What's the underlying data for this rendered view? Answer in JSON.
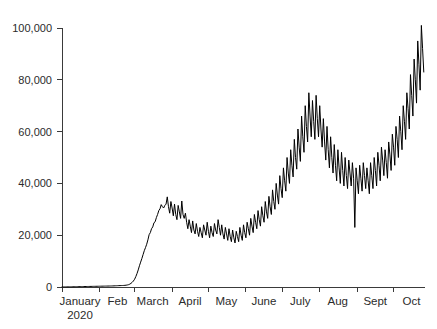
{
  "chart_data": {
    "type": "line",
    "title": "",
    "subtitle": "",
    "xlabel": "",
    "ylabel": "",
    "xlim": [
      0,
      300
    ],
    "ylim": [
      0,
      100000
    ],
    "grid": false,
    "legend": null,
    "line_color": "#000000",
    "axis_color": "#3a3a3a",
    "background_color": "#ffffff",
    "y_ticks": [
      0,
      20000,
      40000,
      60000,
      80000,
      100000
    ],
    "y_tick_labels": [
      "0",
      "20,000",
      "40,000",
      "60,000",
      "80,000",
      "100,000"
    ],
    "x_tick_labels": [
      {
        "label": "January",
        "sublabel": "2020"
      },
      {
        "label": "Feb",
        "sublabel": ""
      },
      {
        "label": "March",
        "sublabel": ""
      },
      {
        "label": "April",
        "sublabel": ""
      },
      {
        "label": "May",
        "sublabel": ""
      },
      {
        "label": "June",
        "sublabel": ""
      },
      {
        "label": "July",
        "sublabel": ""
      },
      {
        "label": "Aug",
        "sublabel": ""
      },
      {
        "label": "Sept",
        "sublabel": ""
      },
      {
        "label": "Oct",
        "sublabel": ""
      }
    ],
    "x_tick_positions_days": [
      0,
      31,
      60,
      91,
      121,
      152,
      182,
      213,
      244,
      274
    ],
    "series": [
      {
        "name": "daily-values",
        "x_start_day": 0,
        "values": [
          20,
          25,
          30,
          35,
          40,
          45,
          55,
          60,
          70,
          80,
          90,
          100,
          110,
          120,
          130,
          140,
          150,
          160,
          170,
          180,
          190,
          200,
          210,
          220,
          230,
          240,
          250,
          260,
          270,
          280,
          290,
          300,
          310,
          320,
          330,
          340,
          350,
          360,
          370,
          380,
          390,
          400,
          420,
          440,
          460,
          480,
          500,
          520,
          540,
          560,
          580,
          600,
          640,
          700,
          780,
          900,
          1100,
          1400,
          1800,
          2300,
          3000,
          4000,
          5200,
          6600,
          8200,
          9600,
          11000,
          12500,
          14000,
          15200,
          16500,
          18200,
          20200,
          21000,
          22500,
          23200,
          24800,
          25200,
          26800,
          28000,
          29500,
          30200,
          31800,
          31000,
          30500,
          31500,
          32000,
          34800,
          31000,
          28500,
          33000,
          30500,
          27500,
          32000,
          28000,
          26000,
          31500,
          29000,
          26500,
          33200,
          28000,
          26500,
          28500,
          25000,
          22500,
          26000,
          23500,
          21000,
          25500,
          22000,
          20500,
          24500,
          21500,
          19500,
          23000,
          21000,
          19000,
          24000,
          22000,
          20000,
          25000,
          21500,
          19000,
          23500,
          21000,
          19500,
          24500,
          22000,
          20500,
          26000,
          23000,
          20000,
          24000,
          20500,
          18500,
          23000,
          20500,
          18000,
          22500,
          19500,
          17500,
          22000,
          19000,
          17000,
          21500,
          19500,
          17500,
          23000,
          20000,
          18000,
          24000,
          21000,
          19000,
          25000,
          22500,
          20000,
          26500,
          23500,
          21000,
          28000,
          25000,
          22500,
          29500,
          26000,
          23500,
          31000,
          27500,
          25000,
          33000,
          29000,
          26500,
          35000,
          31000,
          28000,
          37500,
          33000,
          30000,
          40000,
          35500,
          32000,
          43000,
          38000,
          34500,
          46000,
          41000,
          37000,
          50000,
          44000,
          40000,
          53000,
          47000,
          42500,
          57000,
          50000,
          45500,
          61000,
          54000,
          48500,
          66000,
          58000,
          52000,
          70000,
          62000,
          56000,
          75000,
          66000,
          58000,
          72000,
          64000,
          57000,
          74000,
          65000,
          58000,
          70000,
          61000,
          54000,
          65000,
          56000,
          49000,
          62000,
          53000,
          46000,
          58000,
          50000,
          44000,
          55000,
          47000,
          41000,
          53000,
          46000,
          40000,
          52000,
          45000,
          39000,
          50000,
          43000,
          38000,
          49000,
          44000,
          39000,
          48000,
          42000,
          23000,
          46000,
          41000,
          36000,
          47000,
          42000,
          37000,
          48000,
          43000,
          38000,
          46000,
          41000,
          36000,
          48000,
          43000,
          38000,
          50000,
          45000,
          39000,
          52000,
          47000,
          41000,
          54000,
          49000,
          43000,
          53000,
          48000,
          42000,
          56000,
          51000,
          45000,
          59000,
          54000,
          47000,
          62000,
          57000,
          50000,
          66000,
          60000,
          53000,
          70000,
          64000,
          57000,
          75000,
          69000,
          61000,
          82000,
          74000,
          66000,
          88000,
          80000,
          71000,
          95000,
          86000,
          76000,
          101000,
          92000,
          83000
        ]
      }
    ]
  }
}
